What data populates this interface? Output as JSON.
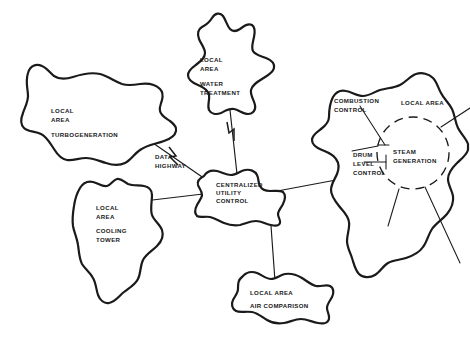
{
  "diagram": {
    "background_color": "#ffffff",
    "stroke_color": "#1a1a1a",
    "nodes": {
      "turbogeneration": {
        "kind": "local-area-blob",
        "line1": "LOCAL",
        "line2": "AREA",
        "line3": "TURBOGENERATION"
      },
      "water_treatment": {
        "kind": "local-area-blob",
        "line1": "LOCAL",
        "line2": "AREA",
        "line3": "WATER",
        "line4": "TREATMENT"
      },
      "cooling_tower": {
        "kind": "local-area-blob",
        "line1": "LOCAL",
        "line2": "AREA",
        "line3": "COOLING",
        "line4": "TOWER"
      },
      "air_comparison": {
        "kind": "local-area-blob",
        "line1": "LOCAL AREA",
        "line2": "AIR COMPARISON"
      },
      "steam_generation_area": {
        "kind": "local-area-blob",
        "area_label": "LOCAL AREA",
        "combustion_control": "COMBUSTION\nCONTROL",
        "drum_level_control": "DRUM\nLEVEL\nCONTROL",
        "steam_generation": "STEAM\nGENERATION"
      },
      "centralized": {
        "kind": "hub-blob",
        "line1": "CENTRALIZED",
        "line2": "UTILITY",
        "line3": "CONTROL"
      }
    },
    "annotations": {
      "data_highway": "DATA\nHIGHWAY"
    }
  }
}
